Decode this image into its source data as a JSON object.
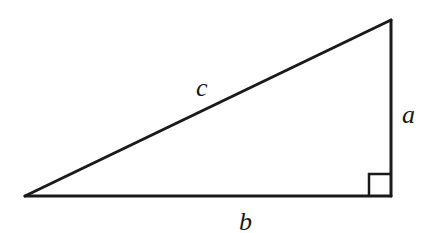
{
  "diagram": {
    "type": "right-triangle",
    "colors": {
      "stroke": "#1a1a1a",
      "background": "#ffffff"
    },
    "vertices": {
      "left": {
        "x": 25,
        "y": 196
      },
      "top_right": {
        "x": 391,
        "y": 20
      },
      "bottom_right": {
        "x": 391,
        "y": 196
      }
    },
    "right_angle_marker": {
      "x": 369,
      "y": 174,
      "size": 22
    },
    "labels": {
      "hypotenuse": "c",
      "vertical_leg": "a",
      "horizontal_leg": "b"
    },
    "label_positions": {
      "c": {
        "x": 196,
        "y": 96
      },
      "a": {
        "x": 402,
        "y": 123
      },
      "b": {
        "x": 239,
        "y": 230
      }
    }
  }
}
